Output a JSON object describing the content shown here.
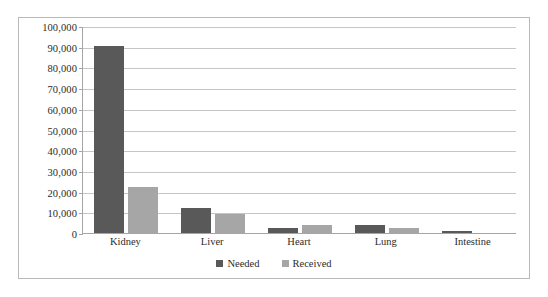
{
  "chart_data": {
    "type": "bar",
    "title": "",
    "xlabel": "",
    "ylabel": "",
    "categories": [
      "Kidney",
      "Liver",
      "Heart",
      "Lung",
      "Intestine"
    ],
    "series": [
      {
        "name": "Needed",
        "color": "#595959",
        "values": [
          90500,
          12000,
          2500,
          4000,
          1000
        ]
      },
      {
        "name": "Received",
        "color": "#a6a6a6",
        "values": [
          22000,
          9000,
          4000,
          2500,
          0
        ]
      }
    ],
    "ylim": [
      0,
      100000
    ],
    "ytick_step": 10000,
    "ytick_labels": [
      "100,000",
      "90,000",
      "80,000",
      "70,000",
      "60,000",
      "50,000",
      "40,000",
      "30,000",
      "20,000",
      "10,000",
      "0"
    ],
    "ytick_values": [
      100000,
      90000,
      80000,
      70000,
      60000,
      50000,
      40000,
      30000,
      20000,
      10000,
      0
    ],
    "grid": true,
    "legend_position": "bottom",
    "legend_entries": [
      "Needed",
      "Received"
    ]
  },
  "styles": {
    "plot_background": "#ffffff",
    "frame_border": "#b9b9b9",
    "axis_line": "#a5a5a5",
    "gridline": "#c6c6c6",
    "text_color": "#2b2b2b"
  }
}
